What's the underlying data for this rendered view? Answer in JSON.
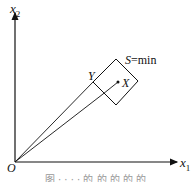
{
  "diagram": {
    "axes": {
      "x_label": "x",
      "x_sub": "1",
      "y_label": "x",
      "y_sub": "2",
      "origin_label": "O"
    },
    "points": {
      "Y_label": "Y",
      "X_label": "X"
    },
    "square_label_var": "S",
    "square_label_rest": "=min",
    "caption": "图 · · · · 的 的 的 的 的"
  }
}
